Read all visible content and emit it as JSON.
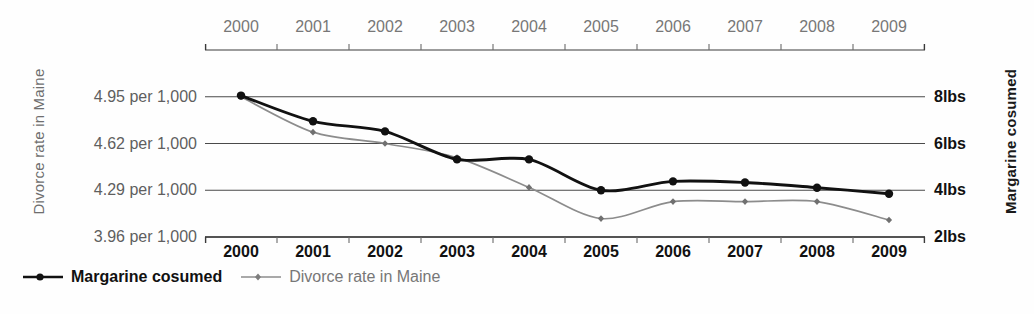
{
  "chart_data": {
    "type": "line",
    "title": "",
    "categories": [
      "2000",
      "2001",
      "2002",
      "2003",
      "2004",
      "2005",
      "2006",
      "2007",
      "2008",
      "2009"
    ],
    "x": [
      2000,
      2001,
      2002,
      2003,
      2004,
      2005,
      2006,
      2007,
      2008,
      2009
    ],
    "series": [
      {
        "name": "Margarine cosumed",
        "axis": "right",
        "units": "lbs",
        "color": "#111111",
        "values": [
          8.05,
          6.95,
          6.52,
          5.32,
          5.32,
          4.0,
          4.38,
          4.33,
          4.11,
          3.85
        ]
      },
      {
        "name": "Divorce rate in Maine",
        "axis": "left",
        "units": "per 1,000",
        "color": "#8c8c8c",
        "values": [
          4.95,
          4.7,
          4.62,
          4.52,
          4.31,
          4.09,
          4.21,
          4.21,
          4.21,
          4.08
        ]
      }
    ],
    "left_axis": {
      "label": "Divorce rate in Maine",
      "tick_labels": [
        "4.95 per 1,000",
        "4.62 per 1,000",
        "4.29 per 1,000",
        "3.96 per 1,000"
      ],
      "tick_values": [
        4.95,
        4.62,
        4.29,
        3.96
      ],
      "ylim": [
        3.96,
        5.28
      ]
    },
    "right_axis": {
      "label": "Margarine cosumed",
      "tick_labels": [
        "8lbs",
        "6lbs",
        "4lbs",
        "2lbs"
      ],
      "tick_values": [
        8,
        6,
        4,
        2
      ],
      "ylim": [
        2,
        10
      ]
    },
    "xlabel": "",
    "grid": true,
    "legend_position": "bottom-left",
    "legend": [
      "Margarine cosumed",
      "Divorce rate in Maine"
    ]
  },
  "axes": {
    "left_title": "Divorce rate in Maine",
    "right_title": "Margarine cosumed"
  },
  "legend": {
    "items": [
      {
        "label": "Margarine cosumed",
        "marker": "filled-circle-dark-line"
      },
      {
        "label": "Divorce rate in Maine",
        "marker": "small-diamond-gray-line"
      }
    ]
  }
}
